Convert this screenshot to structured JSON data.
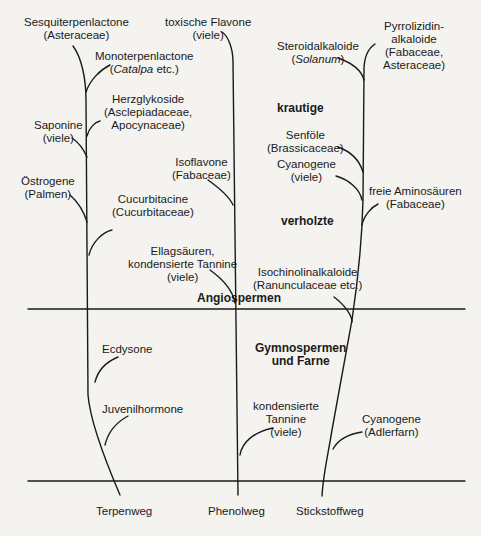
{
  "diagram": {
    "pathways": [
      {
        "label": "Terpenweg"
      },
      {
        "label": "Phenolweg"
      },
      {
        "label": "Stickstoffweg"
      }
    ],
    "zones": {
      "krautige": "krautige",
      "verholzte": "verholzte",
      "angiospermen": "Angiospermen",
      "gymnospermen_line1": "Gymnospermen",
      "gymnospermen_line2": "und Farne"
    },
    "terpene_branches": [
      {
        "line1": "Sesquiterpenlactone",
        "line2": "(Asteraceae)"
      },
      {
        "line1": "Monoterpenlactone",
        "line2_italic": "Catalpa",
        "line2_rest": " etc.)",
        "line2_open": "("
      },
      {
        "line1": "Herzglykoside",
        "line2": "(Asclepiadaceae,",
        "line3": "Apocynaceae)"
      },
      {
        "line1": "Saponine",
        "line2": "(viele)"
      },
      {
        "line1": "Östrogene",
        "line2": "(Palmen)"
      },
      {
        "line1": "Cucurbitacine",
        "line2": "(Cucurbitaceae)"
      },
      {
        "line1": "Ecdysone"
      },
      {
        "line1": "Juvenilhormone"
      }
    ],
    "phenol_branches": [
      {
        "line1": "toxische Flavone",
        "line2": "(viele)"
      },
      {
        "line1": "Isoflavone",
        "line2": "(Fabaceae)"
      },
      {
        "line1": "Ellagsäuren,",
        "line2": "kondensierte Tannine",
        "line3": "(viele)"
      },
      {
        "line1": "kondensierte",
        "line2": "Tannine",
        "line3": "(viele)"
      }
    ],
    "nitrogen_branches": [
      {
        "line1": "Steroidalkaloide",
        "line2_open": "(",
        "line2_italic": "Solanum",
        "line2_rest": ")"
      },
      {
        "line1": "Pyrrolizidin-",
        "line2": "alkaloide",
        "line3": "(Fabaceae,",
        "line4": "Asteraceae)"
      },
      {
        "line1": "Senföle",
        "line2": "(Brassicaceae)"
      },
      {
        "line1": "Cyanogene",
        "line2": "(viele)"
      },
      {
        "line1": "freie Aminosäuren",
        "line2": "(Fabaceae)"
      },
      {
        "line1": "Isochinolinalkaloide",
        "line2": "(Ranunculaceae etc.)"
      },
      {
        "line1": "Cyanogene",
        "line2": "(Adlerfarn)"
      }
    ],
    "colors": {
      "line": "#1a1a1a",
      "background": "#f4f3f0"
    }
  }
}
